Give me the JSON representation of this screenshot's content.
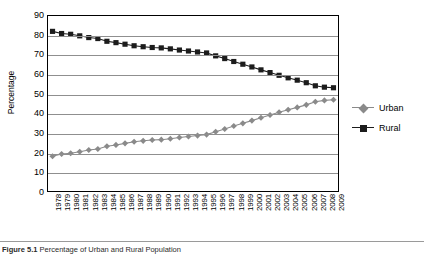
{
  "figure": {
    "caption_label": "Figure",
    "caption_number": "5.1",
    "caption_text": "Percentage of Urban and Rural Population"
  },
  "chart_data": {
    "type": "line",
    "title": "",
    "xlabel": "",
    "ylabel": "Percentage",
    "ylim": [
      0,
      90
    ],
    "ytick_step": 10,
    "yticks": [
      0,
      10,
      20,
      30,
      40,
      50,
      60,
      70,
      80,
      90
    ],
    "grid": true,
    "legend_position": "right",
    "categories": [
      "1978",
      "1979",
      "1980",
      "1981",
      "1982",
      "1983",
      "1984",
      "1985",
      "1986",
      "1987",
      "1988",
      "1989",
      "1990",
      "1991",
      "1992",
      "1993",
      "1994",
      "1995",
      "1996",
      "1997",
      "1998",
      "1999",
      "2000",
      "2001",
      "2002",
      "2003",
      "2004",
      "2005",
      "2006",
      "2007",
      "2008",
      "2009"
    ],
    "series": [
      {
        "name": "Urban",
        "color": "#8a8a8a",
        "marker": "diamond",
        "values": [
          17.9,
          19.0,
          19.4,
          20.2,
          21.1,
          21.6,
          23.0,
          23.7,
          24.5,
          25.3,
          25.8,
          26.2,
          26.4,
          26.9,
          27.5,
          28.0,
          28.5,
          29.0,
          30.5,
          31.9,
          33.4,
          34.8,
          36.2,
          37.7,
          39.1,
          40.5,
          41.8,
          43.0,
          44.3,
          45.9,
          46.6,
          46.9
        ]
      },
      {
        "name": "Rural",
        "color": "#1c1c1c",
        "marker": "square",
        "values": [
          82.1,
          81.0,
          80.6,
          79.8,
          78.9,
          78.4,
          77.0,
          76.3,
          75.5,
          74.7,
          74.2,
          73.8,
          73.6,
          73.1,
          72.5,
          72.0,
          71.5,
          71.0,
          69.5,
          68.1,
          66.6,
          65.2,
          63.8,
          62.3,
          60.9,
          59.5,
          58.2,
          57.0,
          55.7,
          54.1,
          53.4,
          53.1
        ]
      }
    ]
  }
}
